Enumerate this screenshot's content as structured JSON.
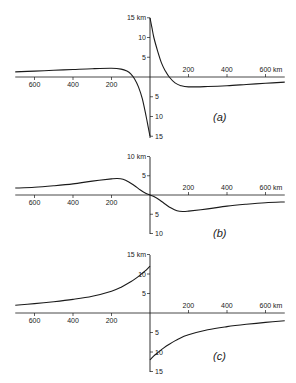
{
  "figure": {
    "width": 296,
    "height": 383,
    "line_color": "#1a1a1a",
    "background": "#ffffff"
  },
  "chart_data": [
    {
      "type": "line",
      "panel_label": "(a)",
      "xlabel_unit": "km",
      "ylabel_unit": "km",
      "x_ticks": [
        -600,
        -400,
        -200,
        200,
        400,
        600
      ],
      "x_tick_labels": [
        "600",
        "400",
        "200",
        "200",
        "400",
        "600 km"
      ],
      "y_ticks_up": [
        5,
        10,
        15
      ],
      "y_tick_labels_up": [
        "5",
        "10",
        "15 km"
      ],
      "y_ticks_down": [
        -5,
        -10,
        -15
      ],
      "y_tick_labels_down": [
        "5",
        "10",
        "15"
      ],
      "xlim": [
        -700,
        700
      ],
      "ylim": [
        -15,
        15
      ],
      "layout": {
        "origin_x": 150,
        "origin_y": 77,
        "px_per_km_x": 0.1925,
        "px_per_km_y": 3.95,
        "axis_top": 18,
        "axis_bottom": 138,
        "label_x": 213,
        "label_y": 121
      },
      "series": [
        {
          "name": "left branch",
          "x": [
            -700,
            -600,
            -500,
            -400,
            -300,
            -200,
            -150,
            -120,
            -100,
            -80,
            -60,
            -40,
            -20,
            -10,
            0
          ],
          "y": [
            1.3,
            1.5,
            1.7,
            1.9,
            2.1,
            2.2,
            2.0,
            1.5,
            0.8,
            -0.5,
            -2.5,
            -5.5,
            -10,
            -12.5,
            -15
          ]
        },
        {
          "name": "right branch",
          "x": [
            0,
            10,
            20,
            40,
            60,
            80,
            100,
            130,
            160,
            200,
            300,
            400,
            500,
            600,
            700
          ],
          "y": [
            15,
            12.5,
            10,
            6.5,
            3.5,
            1.5,
            0,
            -1.5,
            -2.2,
            -2.5,
            -2.4,
            -2.2,
            -1.9,
            -1.6,
            -1.3
          ]
        }
      ],
      "grid": false
    },
    {
      "type": "line",
      "panel_label": "(b)",
      "xlabel_unit": "km",
      "ylabel_unit": "km",
      "x_ticks": [
        -600,
        -400,
        -200,
        200,
        400,
        600
      ],
      "x_tick_labels": [
        "600",
        "400",
        "200",
        "200",
        "400",
        "600 km"
      ],
      "y_ticks_up": [
        5,
        10
      ],
      "y_tick_labels_up": [
        "5",
        "10 km"
      ],
      "y_ticks_down": [
        -5,
        -10
      ],
      "y_tick_labels_down": [
        "5",
        "10"
      ],
      "xlim": [
        -700,
        700
      ],
      "ylim": [
        -10,
        10
      ],
      "layout": {
        "origin_x": 150,
        "origin_y": 195,
        "px_per_km_x": 0.1925,
        "px_per_km_y": 3.85,
        "axis_top": 157,
        "axis_bottom": 234,
        "label_x": 213,
        "label_y": 237
      },
      "series": [
        {
          "name": "profile",
          "x": [
            -700,
            -600,
            -500,
            -400,
            -300,
            -200,
            -170,
            -140,
            -110,
            -80,
            -50,
            -20,
            0,
            20,
            50,
            80,
            110,
            140,
            170,
            200,
            300,
            400,
            500,
            600,
            700
          ],
          "y": [
            1.8,
            2.0,
            2.4,
            2.9,
            3.6,
            4.2,
            4.3,
            4.1,
            3.4,
            2.4,
            1.3,
            0.4,
            0,
            -0.4,
            -1.3,
            -2.4,
            -3.4,
            -4.1,
            -4.3,
            -4.2,
            -3.6,
            -2.9,
            -2.4,
            -2.0,
            -1.8
          ]
        }
      ],
      "grid": false
    },
    {
      "type": "line",
      "panel_label": "(c)",
      "xlabel_unit": "km",
      "ylabel_unit": "km",
      "x_ticks": [
        -600,
        -400,
        -200,
        200,
        400,
        600
      ],
      "x_tick_labels": [
        "600",
        "400",
        "200",
        "200",
        "400",
        "600 km"
      ],
      "y_ticks_up": [
        5,
        10,
        15
      ],
      "y_tick_labels_up": [
        "5",
        "10",
        "15 km"
      ],
      "y_ticks_down": [
        -5,
        -10,
        -15
      ],
      "y_tick_labels_down": [
        "5",
        "10",
        "15"
      ],
      "xlim": [
        -700,
        700
      ],
      "ylim": [
        -15,
        15
      ],
      "layout": {
        "origin_x": 150,
        "origin_y": 313,
        "px_per_km_x": 0.1925,
        "px_per_km_y": 3.9,
        "axis_top": 255,
        "axis_bottom": 372,
        "label_x": 213,
        "label_y": 360
      },
      "series": [
        {
          "name": "left branch",
          "x": [
            -700,
            -600,
            -500,
            -400,
            -300,
            -200,
            -150,
            -100,
            -70,
            -40,
            -20,
            0
          ],
          "y": [
            2.0,
            2.4,
            2.9,
            3.5,
            4.3,
            5.6,
            6.6,
            8.0,
            9.0,
            10.2,
            11.0,
            12.0
          ]
        },
        {
          "name": "right branch",
          "x": [
            0,
            20,
            40,
            70,
            100,
            150,
            200,
            300,
            400,
            500,
            600,
            700
          ],
          "y": [
            -12.0,
            -11.0,
            -10.2,
            -9.0,
            -8.0,
            -6.6,
            -5.6,
            -4.3,
            -3.5,
            -2.9,
            -2.4,
            -2.0
          ]
        }
      ],
      "grid": false
    }
  ]
}
